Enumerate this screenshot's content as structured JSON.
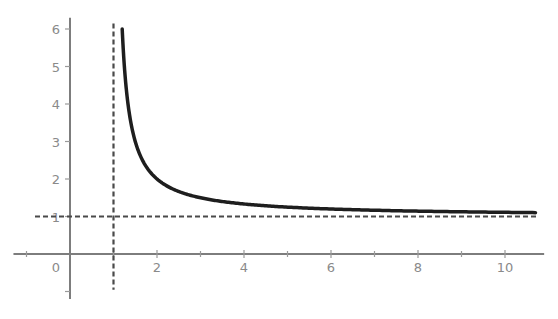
{
  "chart_data": {
    "type": "line",
    "title": "",
    "xlabel": "",
    "ylabel": "",
    "function": "y = x / (x - 1)",
    "series": [
      {
        "name": "curve",
        "color": "#1e1e1e",
        "x": [
          1.2,
          1.25,
          1.33,
          1.5,
          1.75,
          2,
          2.5,
          3,
          4,
          5,
          6,
          7,
          8,
          9,
          10,
          10.7
        ],
        "values": [
          6.0,
          5.0,
          4.0,
          3.0,
          2.33,
          2.0,
          1.67,
          1.5,
          1.33,
          1.25,
          1.2,
          1.17,
          1.14,
          1.13,
          1.11,
          1.1
        ]
      }
    ],
    "asymptotes": {
      "vertical": {
        "x": 1,
        "style": "dashed",
        "color": "#4a4a4a"
      },
      "horizontal": {
        "y": 1,
        "style": "dashed",
        "color": "#4a4a4a"
      }
    },
    "x_ticks": {
      "major": [
        2,
        4,
        6,
        8,
        10
      ],
      "minor": [
        -1,
        1,
        3,
        5,
        7,
        9
      ]
    },
    "x_tick_labels": [
      "0",
      "2",
      "4",
      "6",
      "8",
      "10"
    ],
    "y_ticks": [
      1,
      2,
      3,
      4,
      5,
      6
    ],
    "y_tick_labels": [
      "1",
      "2",
      "3",
      "4",
      "5",
      "6"
    ],
    "xlim": [
      -1.3,
      10.9
    ],
    "ylim": [
      -1.2,
      6.3
    ],
    "grid": false,
    "legend": null
  },
  "layout": {
    "origin_px": [
      70,
      254
    ],
    "x_unit_px": 43.5,
    "y_unit_px": 37.5
  }
}
